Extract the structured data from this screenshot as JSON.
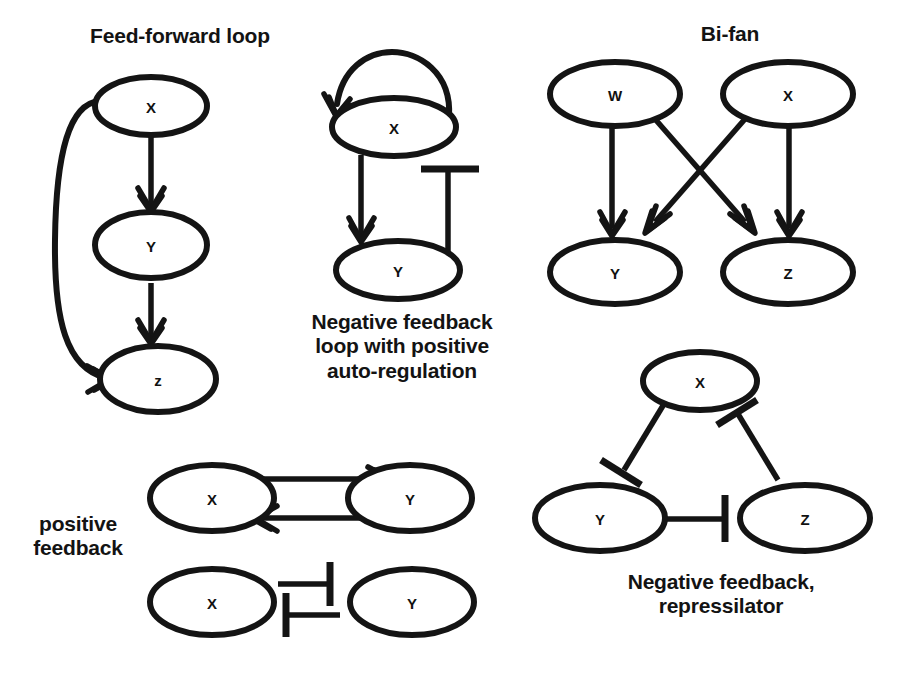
{
  "figure": {
    "background_color": "#ffffff",
    "ink_color": "#141414",
    "width": 902,
    "height": 675
  },
  "motifs": {
    "feed_forward": {
      "title": "Feed-forward loop",
      "nodes": [
        {
          "id": "x",
          "label": "X"
        },
        {
          "id": "y",
          "label": "Y"
        },
        {
          "id": "z",
          "label": "z"
        }
      ],
      "edges": [
        {
          "from": "X",
          "to": "Y",
          "type": "activation"
        },
        {
          "from": "Y",
          "to": "z",
          "type": "activation"
        },
        {
          "from": "X",
          "to": "z",
          "type": "activation"
        }
      ]
    },
    "negative_feedback_auto": {
      "title": "Negative feedback\nloop with positive\nauto-regulation",
      "nodes": [
        {
          "id": "x",
          "label": "X"
        },
        {
          "id": "y",
          "label": "Y"
        }
      ],
      "edges": [
        {
          "from": "X",
          "to": "X",
          "type": "activation"
        },
        {
          "from": "X",
          "to": "Y",
          "type": "activation"
        },
        {
          "from": "Y",
          "to": "X",
          "type": "inhibition"
        }
      ]
    },
    "bi_fan": {
      "title": "Bi-fan",
      "nodes": [
        {
          "id": "w",
          "label": "W"
        },
        {
          "id": "x",
          "label": "X"
        },
        {
          "id": "y",
          "label": "Y"
        },
        {
          "id": "z",
          "label": "Z"
        }
      ],
      "edges": [
        {
          "from": "W",
          "to": "Y",
          "type": "activation"
        },
        {
          "from": "W",
          "to": "Z",
          "type": "activation"
        },
        {
          "from": "X",
          "to": "Y",
          "type": "activation"
        },
        {
          "from": "X",
          "to": "Z",
          "type": "activation"
        }
      ]
    },
    "positive_feedback": {
      "title": "positive\nfeedback",
      "pair_activation": {
        "nodes": [
          {
            "id": "x",
            "label": "X"
          },
          {
            "id": "y",
            "label": "Y"
          }
        ],
        "edges": [
          {
            "from": "X",
            "to": "Y",
            "type": "activation"
          },
          {
            "from": "Y",
            "to": "X",
            "type": "activation"
          }
        ]
      },
      "pair_inhibition": {
        "nodes": [
          {
            "id": "x",
            "label": "X"
          },
          {
            "id": "y",
            "label": "Y"
          }
        ],
        "edges": [
          {
            "from": "X",
            "to": "Y",
            "type": "inhibition"
          },
          {
            "from": "Y",
            "to": "X",
            "type": "inhibition"
          }
        ]
      }
    },
    "repressilator": {
      "title": "Negative feedback,\nrepressilator",
      "nodes": [
        {
          "id": "x",
          "label": "X"
        },
        {
          "id": "y",
          "label": "Y"
        },
        {
          "id": "z",
          "label": "Z"
        }
      ],
      "edges": [
        {
          "from": "X",
          "to": "Y",
          "type": "inhibition"
        },
        {
          "from": "Y",
          "to": "Z",
          "type": "inhibition"
        },
        {
          "from": "Z",
          "to": "X",
          "type": "inhibition"
        }
      ]
    }
  }
}
